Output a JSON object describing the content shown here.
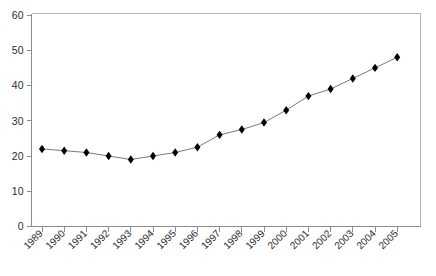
{
  "chart_data": {
    "type": "line",
    "title": "",
    "xlabel": "",
    "ylabel": "",
    "categories": [
      "1989",
      "1990",
      "1991",
      "1992",
      "1993",
      "1994",
      "1995",
      "1996",
      "1997",
      "1998",
      "1999",
      "2000",
      "2001",
      "2002",
      "2003",
      "2004",
      "2005"
    ],
    "values": [
      22,
      21.5,
      21,
      20,
      19,
      20,
      21,
      22.5,
      26,
      27.5,
      29.5,
      33,
      37,
      39,
      42,
      45,
      48
    ],
    "series": [
      {
        "name": "series-1",
        "values": [
          22,
          21.5,
          21,
          20,
          19,
          20,
          21,
          22.5,
          26,
          27.5,
          29.5,
          33,
          37,
          39,
          42,
          45,
          48
        ]
      }
    ],
    "ylim": [
      0,
      60
    ],
    "yticks": [
      0,
      10,
      20,
      30,
      40,
      50,
      60
    ],
    "ytick_labels": [
      "0",
      "10",
      "20",
      "30",
      "40",
      "50",
      "60"
    ],
    "xtick_labels": [
      "1989",
      "1990",
      "1991",
      "1992",
      "1993",
      "1994",
      "1995",
      "1996",
      "1997",
      "1998",
      "1999",
      "2000",
      "2001",
      "2002",
      "2003",
      "2004",
      "2005"
    ],
    "grid": false,
    "legend": false,
    "legend_position": "none",
    "marker": "diamond",
    "marker_color": "#000000",
    "line_color": "#7a7a7a",
    "axis_color": "#8c8c8c",
    "background_color": "#ffffff",
    "xtick_label_rotation": 45
  }
}
